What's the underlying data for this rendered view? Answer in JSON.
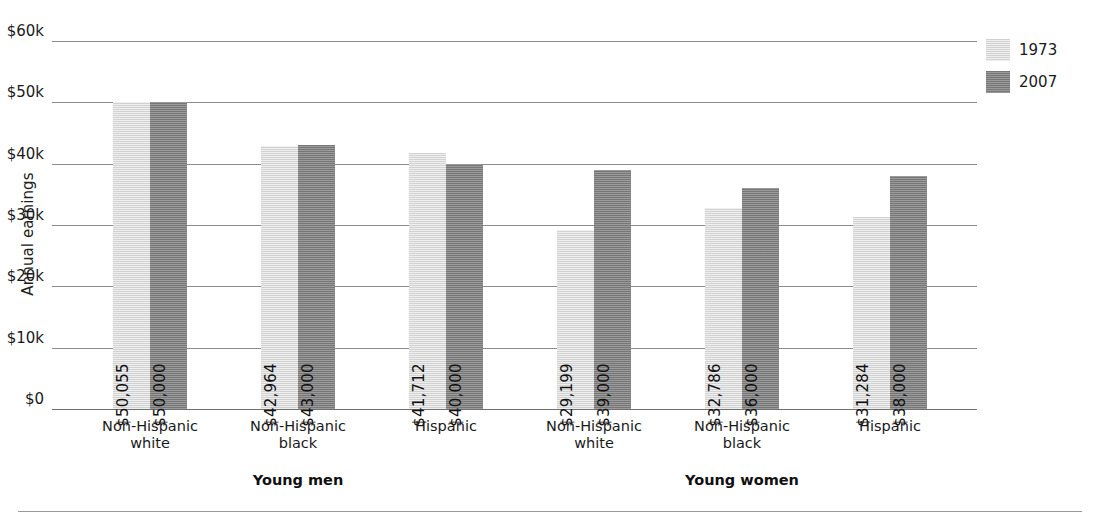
{
  "chart_data": {
    "type": "bar",
    "title": "",
    "xlabel": "",
    "ylabel": "Annual earnings",
    "ylim": [
      0,
      60000
    ],
    "grid": true,
    "legend_position": "top-right",
    "ytick_labels": [
      "$60k",
      "$50k",
      "$40k",
      "$30k",
      "$20k",
      "$10k",
      "$0"
    ],
    "ytick_values": [
      60000,
      50000,
      40000,
      30000,
      20000,
      10000,
      0
    ],
    "categories": [
      "Non-Hispanic white",
      "Non-Hispanic black",
      "Hispanic",
      "Non-Hispanic white",
      "Non-Hispanic black",
      "Hispanic"
    ],
    "category_lines": [
      [
        "Non-Hispanic",
        "white"
      ],
      [
        "Non-Hispanic",
        "black"
      ],
      [
        "Hispanic",
        ""
      ],
      [
        "Non-Hispanic",
        "white"
      ],
      [
        "Non-Hispanic",
        "black"
      ],
      [
        "Hispanic",
        ""
      ]
    ],
    "groups": [
      {
        "label": "Young men",
        "categories": [
          0,
          1,
          2
        ]
      },
      {
        "label": "Young women",
        "categories": [
          3,
          4,
          5
        ]
      }
    ],
    "series": [
      {
        "name": "1973",
        "color": "#dcdcdc",
        "values": [
          50055,
          42964,
          41712,
          29199,
          32786,
          31284
        ],
        "labels": [
          "$50,055",
          "$42,964",
          "$41,712",
          "$29,199",
          "$32,786",
          "$31,284"
        ]
      },
      {
        "name": "2007",
        "color": "#848484",
        "values": [
          50000,
          43000,
          40000,
          39000,
          36000,
          38000
        ],
        "labels": [
          "$50,000",
          "$43,000",
          "$40,000",
          "$39,000",
          "$36,000",
          "$38,000"
        ]
      }
    ]
  }
}
